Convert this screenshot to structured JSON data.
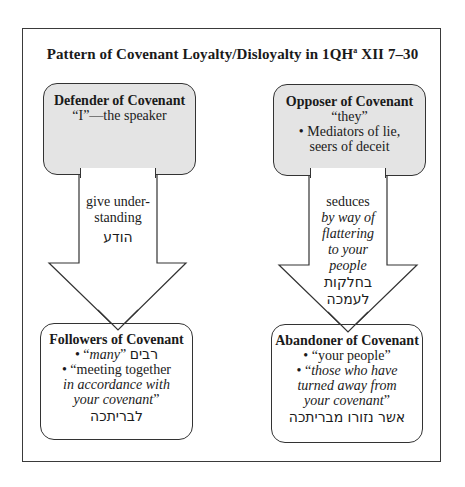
{
  "diagram": {
    "title_main": "Pattern of Covenant Loyalty/Disloyalty in 1QH",
    "title_sup": "a",
    "title_tail": " XII 7–30",
    "defender": {
      "heading": "Defender of Covenant",
      "line1": "“I”—the speaker"
    },
    "opposer": {
      "heading": "Opposer of Covenant",
      "line1": "“they”",
      "line2": "• Mediators of lie,",
      "line3": "seers of deceit"
    },
    "left_arrow": {
      "line1": "give under-",
      "line2": "standing",
      "hebrew": "הודע"
    },
    "right_arrow": {
      "line1": "seduces",
      "line2": "by way of",
      "line3": "flattering",
      "line4": "to your",
      "line5": "people",
      "hebrew1": "בחלקות",
      "hebrew2": "לעמכה"
    },
    "followers": {
      "heading": "Followers of Covenant",
      "item1_bullet": "• “",
      "item1_italic": "many",
      "item1_close": "” ",
      "item1_hebrew": "רבים",
      "item2_line1": "• “meeting together",
      "item2_line2": "in accordance with",
      "item2_line3": "your covenant",
      "item2_close": "”",
      "hebrew": "לבריתכה"
    },
    "abandoner": {
      "heading": "Abandoner of Covenant",
      "item1": "• “your people”",
      "item2_bullet": "• “",
      "item2_line1": "those who have",
      "item2_line2": "turned away from",
      "item2_line3": "your covenant",
      "item2_close": "”",
      "hebrew": "אשר נזורו מבריתכה"
    },
    "colors": {
      "shaded_box": "#e4e4e4",
      "border": "#333333",
      "background": "#ffffff"
    }
  }
}
